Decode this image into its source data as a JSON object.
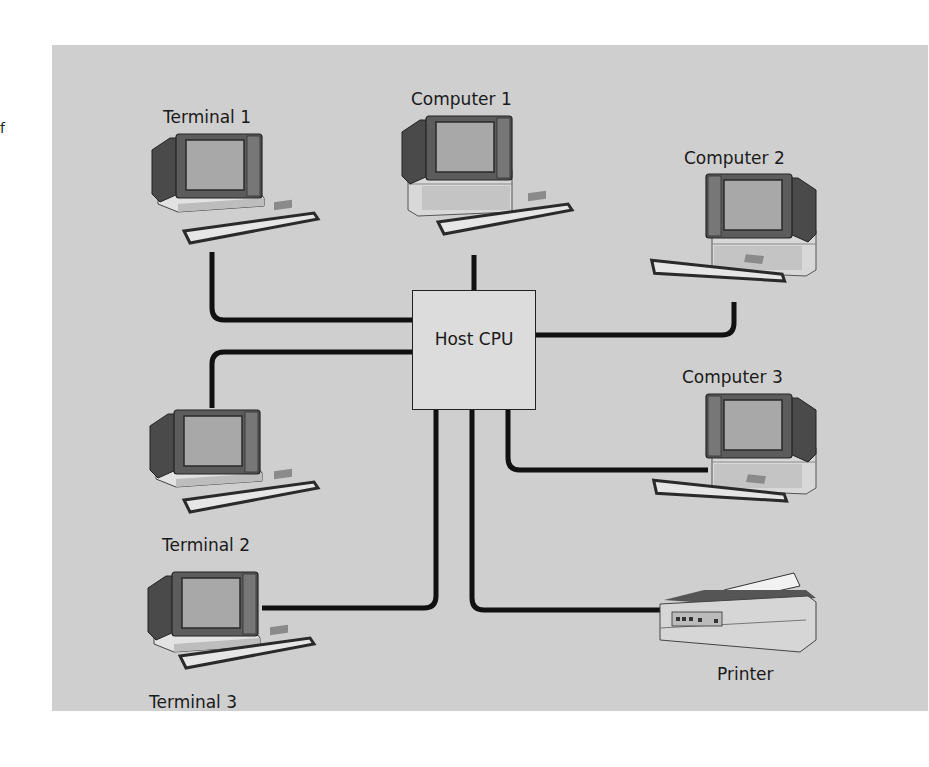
{
  "stray_text": "f",
  "diagram": {
    "hub": {
      "label": "Host CPU"
    },
    "nodes": [
      {
        "id": "terminal-1",
        "label": "Terminal 1",
        "type": "terminal"
      },
      {
        "id": "computer-1",
        "label": "Computer 1",
        "type": "computer"
      },
      {
        "id": "computer-2",
        "label": "Computer 2",
        "type": "computer"
      },
      {
        "id": "terminal-2",
        "label": "Terminal 2",
        "type": "terminal"
      },
      {
        "id": "computer-3",
        "label": "Computer 3",
        "type": "computer"
      },
      {
        "id": "terminal-3",
        "label": "Terminal 3",
        "type": "terminal"
      },
      {
        "id": "printer",
        "label": "Printer",
        "type": "printer"
      }
    ],
    "edges": [
      {
        "from": "Host CPU",
        "to": "Terminal 1"
      },
      {
        "from": "Host CPU",
        "to": "Computer 1"
      },
      {
        "from": "Host CPU",
        "to": "Computer 2"
      },
      {
        "from": "Host CPU",
        "to": "Terminal 2"
      },
      {
        "from": "Host CPU",
        "to": "Computer 3"
      },
      {
        "from": "Host CPU",
        "to": "Terminal 3"
      },
      {
        "from": "Host CPU",
        "to": "Printer"
      }
    ],
    "colors": {
      "background": "#cfcfcf",
      "cable": "#111111",
      "hub_fill": "#dcdcdc"
    }
  }
}
